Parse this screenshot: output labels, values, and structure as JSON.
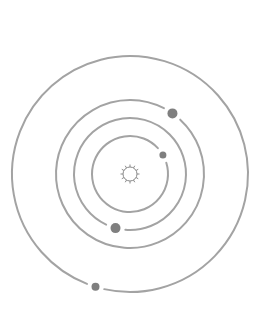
{
  "diagram": {
    "title": "",
    "colors": {
      "orbit": "#a3a3a3",
      "planet": "#7f7f7f",
      "sun": "#8a8a8a",
      "background": "#ffffff"
    },
    "center": {
      "x": 130,
      "y": 174
    },
    "sun": {
      "radius": 9,
      "rays": 12
    },
    "orbits": [
      {
        "name": "orbit-1",
        "radius": 38,
        "planet": {
          "angle_deg": -30,
          "radius": 3.5
        }
      },
      {
        "name": "orbit-2",
        "radius": 56,
        "planet": {
          "angle_deg": 105,
          "radius": 5
        }
      },
      {
        "name": "orbit-3",
        "radius": 74,
        "planet": {
          "angle_deg": -55,
          "radius": 5
        }
      },
      {
        "name": "orbit-4",
        "radius": 118,
        "planet": {
          "angle_deg": 107,
          "radius": 4
        }
      }
    ]
  }
}
